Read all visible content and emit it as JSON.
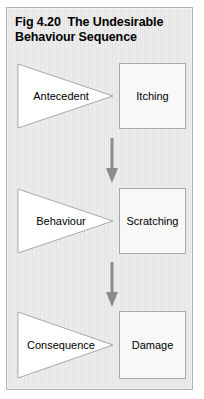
{
  "figure": {
    "title": "Fig 4.20  The Undesirable Behaviour Sequence",
    "frame_border_color": "#b4b4b4",
    "background_color": "#eaeaea",
    "arrow_color": "#8c8c8c",
    "shape_outline_color": "#a8a8a8",
    "shape_fill_color": "#f8f8f8",
    "text_color": "#000000"
  },
  "rows": [
    {
      "trigger": {
        "label": "Antecedent",
        "icon": "right-triangle-shape"
      },
      "result": {
        "label": "Itching",
        "icon": "rectangle-shape"
      }
    },
    {
      "trigger": {
        "label": "Behaviour",
        "icon": "right-triangle-shape"
      },
      "result": {
        "label": "Scratching",
        "icon": "rectangle-shape"
      }
    },
    {
      "trigger": {
        "label": "Consequence",
        "icon": "right-triangle-shape"
      },
      "result": {
        "label": "Damage",
        "icon": "rectangle-shape"
      }
    }
  ],
  "connectors": [
    {
      "icon": "down-arrow-icon"
    },
    {
      "icon": "down-arrow-icon"
    }
  ]
}
